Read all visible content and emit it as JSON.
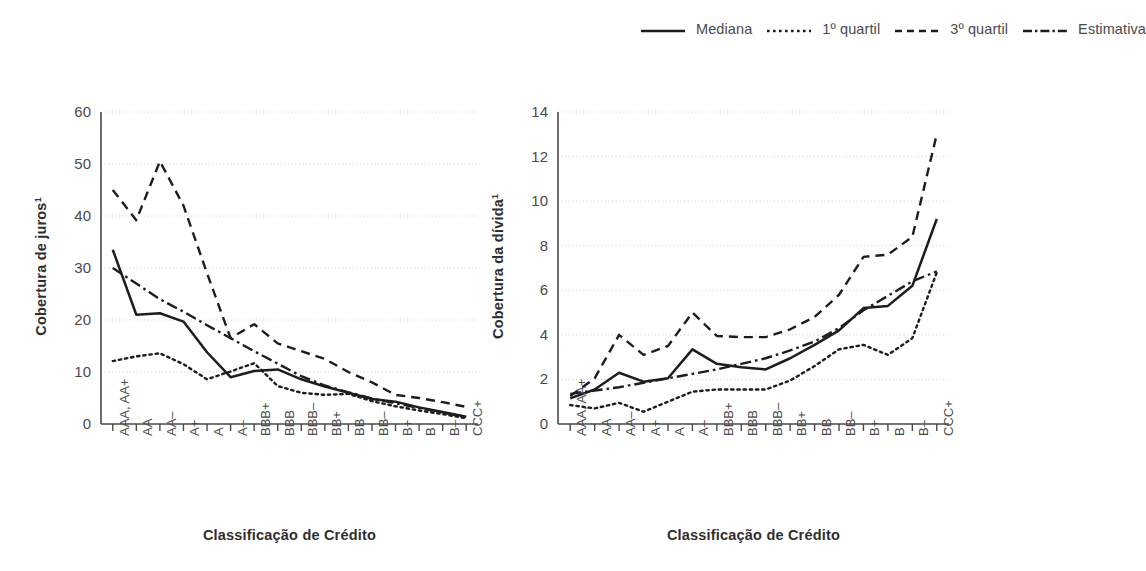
{
  "legend": {
    "entries": [
      {
        "label": "Mediana",
        "style": "solid",
        "icon": "solid-line-icon"
      },
      {
        "label": "1º quartil",
        "style": "dotted",
        "icon": "dotted-line-icon"
      },
      {
        "label": "3º quartil",
        "style": "dashed",
        "icon": "dashed-line-icon"
      },
      {
        "label": "Estimativa",
        "style": "dashdot",
        "icon": "dash-dot-line-icon"
      }
    ]
  },
  "colors": {
    "line": "#1d1d1d",
    "grid": "#c9c9c9",
    "axis": "#4a4a4a",
    "text": "#3b3b3b"
  },
  "chart_data": [
    {
      "type": "line",
      "id": "cobertura-de-juros",
      "title": "",
      "xlabel": "Classificação de Crédito",
      "ylabel": "Cobertura de juros",
      "ylabel_sup": "1",
      "ylim": [
        0,
        60
      ],
      "yticks": [
        0,
        10,
        20,
        30,
        40,
        50,
        60
      ],
      "grid": true,
      "legend_position": "figure-top-right",
      "categories": [
        "AAA, AA+",
        "AA",
        "AA–",
        "A+",
        "A",
        "A–",
        "BBB+",
        "BBB",
        "BBB–",
        "BB+",
        "BB",
        "BB–",
        "B+",
        "B",
        "B–",
        "CCC+"
      ],
      "series": [
        {
          "name": "Mediana",
          "style": "solid",
          "values": [
            33.5,
            21.0,
            21.3,
            19.7,
            13.8,
            9.0,
            10.2,
            10.5,
            8.6,
            7.2,
            6.0,
            4.8,
            4.3,
            3.2,
            2.3,
            1.4
          ]
        },
        {
          "name": "3º quartil",
          "style": "dashed",
          "values": [
            45.0,
            39.2,
            50.5,
            42.0,
            29.0,
            16.5,
            19.2,
            15.5,
            14.0,
            12.5,
            10.0,
            8.0,
            5.6,
            5.0,
            4.2,
            3.3
          ]
        },
        {
          "name": "1º quartil",
          "style": "dotted",
          "values": [
            12.1,
            13.0,
            13.6,
            11.5,
            8.6,
            10.1,
            11.7,
            7.3,
            6.0,
            5.6,
            5.8,
            4.4,
            3.4,
            2.6,
            1.9,
            1.1
          ]
        },
        {
          "name": "Estimativa",
          "style": "dashdot",
          "values": [
            30.0,
            27.0,
            24.0,
            21.6,
            19.0,
            16.5,
            14.0,
            11.6,
            9.2,
            7.4,
            6.1,
            4.9,
            4.0,
            3.1,
            2.2,
            1.3
          ]
        }
      ]
    },
    {
      "type": "line",
      "id": "cobertura-da-divida",
      "title": "",
      "xlabel": "Classificação de Crédito",
      "ylabel": "Cobertura da dívida",
      "ylabel_sup": "1",
      "ylim": [
        0,
        14
      ],
      "yticks": [
        0,
        2,
        4,
        6,
        8,
        10,
        12,
        14
      ],
      "grid": true,
      "legend_position": "figure-top-right",
      "categories": [
        "AAA, AA+",
        "AA",
        "AA–",
        "A+",
        "A",
        "A–",
        "BBB+",
        "BBB",
        "BBB–",
        "BB+",
        "BB",
        "BB–",
        "B+",
        "B",
        "B–",
        "CCC+"
      ],
      "series": [
        {
          "name": "Mediana",
          "style": "solid",
          "values": [
            1.15,
            1.55,
            2.3,
            1.9,
            2.05,
            3.35,
            2.7,
            2.55,
            2.45,
            2.95,
            3.55,
            4.2,
            5.2,
            5.3,
            6.2,
            9.2
          ]
        },
        {
          "name": "3º quartil",
          "style": "dashed",
          "values": [
            1.25,
            2.05,
            4.0,
            3.1,
            3.5,
            5.0,
            3.95,
            3.9,
            3.9,
            4.25,
            4.8,
            5.8,
            7.5,
            7.6,
            8.4,
            13.0
          ]
        },
        {
          "name": "1º quartil",
          "style": "dotted",
          "values": [
            0.85,
            0.7,
            0.95,
            0.55,
            1.0,
            1.45,
            1.55,
            1.55,
            1.55,
            1.95,
            2.6,
            3.35,
            3.55,
            3.1,
            3.85,
            6.8
          ]
        },
        {
          "name": "Estimativa",
          "style": "dashdot",
          "values": [
            1.35,
            1.5,
            1.65,
            1.85,
            2.05,
            2.25,
            2.45,
            2.7,
            2.95,
            3.3,
            3.7,
            4.3,
            5.1,
            5.75,
            6.4,
            6.85
          ]
        }
      ]
    }
  ]
}
